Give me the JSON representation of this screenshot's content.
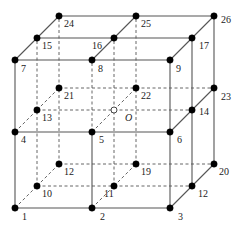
{
  "diagram": {
    "type": "3x3x3 cubic lattice of nodes (26 numbered nodes + center O)",
    "colors": {
      "line": "#555555",
      "node": "#000000",
      "center_node_fill": "#ffffff",
      "background": "#ffffff"
    },
    "offset": {
      "dx": 22,
      "dy": -22
    },
    "nodes": [
      {
        "id": "1",
        "label": "1",
        "x": 15,
        "y": 208,
        "lx": 7,
        "ly": 12
      },
      {
        "id": "2",
        "label": "2",
        "x": 92,
        "y": 208,
        "lx": 8,
        "ly": 12
      },
      {
        "id": "3",
        "label": "3",
        "x": 170,
        "y": 208,
        "lx": 8,
        "ly": 12
      },
      {
        "id": "4",
        "label": "4",
        "x": 15,
        "y": 132,
        "lx": 6,
        "ly": 11
      },
      {
        "id": "5",
        "label": "5",
        "x": 92,
        "y": 132,
        "lx": 7,
        "ly": 11
      },
      {
        "id": "6",
        "label": "6",
        "x": 170,
        "y": 132,
        "lx": 7,
        "ly": 11
      },
      {
        "id": "7",
        "label": "7",
        "x": 15,
        "y": 60,
        "lx": 6,
        "ly": 12
      },
      {
        "id": "8",
        "label": "8",
        "x": 92,
        "y": 60,
        "lx": 6,
        "ly": 12
      },
      {
        "id": "9",
        "label": "9",
        "x": 170,
        "y": 60,
        "lx": 6,
        "ly": 12
      },
      {
        "id": "10",
        "label": "10",
        "x": 37,
        "y": 186,
        "lx": 5,
        "ly": 11
      },
      {
        "id": "11",
        "label": "11",
        "x": 114,
        "y": 186,
        "lx": -10,
        "ly": 11
      },
      {
        "id": "12a",
        "label": "12",
        "x": 192,
        "y": 186,
        "lx": 6,
        "ly": 11
      },
      {
        "id": "13",
        "label": "13",
        "x": 37,
        "y": 110,
        "lx": 5,
        "ly": 11
      },
      {
        "id": "O",
        "label": "O",
        "x": 114,
        "y": 110,
        "lx": 11,
        "ly": 11,
        "hollow": true,
        "italic": true
      },
      {
        "id": "14",
        "label": "14",
        "x": 192,
        "y": 110,
        "lx": 7,
        "ly": 5
      },
      {
        "id": "15",
        "label": "15",
        "x": 37,
        "y": 38,
        "lx": 5,
        "ly": 11
      },
      {
        "id": "16",
        "label": "16",
        "x": 114,
        "y": 38,
        "lx": -22,
        "ly": 11
      },
      {
        "id": "17",
        "label": "17",
        "x": 192,
        "y": 38,
        "lx": 7,
        "ly": 11
      },
      {
        "id": "12b",
        "label": "12",
        "x": 59,
        "y": 164,
        "lx": 5,
        "ly": 11
      },
      {
        "id": "19",
        "label": "19",
        "x": 136,
        "y": 164,
        "lx": 5,
        "ly": 11
      },
      {
        "id": "20",
        "label": "20",
        "x": 214,
        "y": 164,
        "lx": 5,
        "ly": 11
      },
      {
        "id": "21",
        "label": "21",
        "x": 59,
        "y": 88,
        "lx": 5,
        "ly": 11
      },
      {
        "id": "22",
        "label": "22",
        "x": 136,
        "y": 88,
        "lx": 5,
        "ly": 11
      },
      {
        "id": "23",
        "label": "23",
        "x": 214,
        "y": 88,
        "lx": 7,
        "ly": 12
      },
      {
        "id": "24",
        "label": "24",
        "x": 59,
        "y": 16,
        "lx": 5,
        "ly": 11
      },
      {
        "id": "25",
        "label": "25",
        "x": 136,
        "y": 16,
        "lx": 5,
        "ly": 11
      },
      {
        "id": "26",
        "label": "26",
        "x": 214,
        "y": 16,
        "lx": 7,
        "ly": 7
      }
    ],
    "solid_edges": [
      [
        "1",
        "3"
      ],
      [
        "4",
        "6"
      ],
      [
        "7",
        "9"
      ],
      [
        "1",
        "7"
      ],
      [
        "2",
        "5"
      ],
      [
        "3",
        "9"
      ],
      [
        "7",
        "24"
      ],
      [
        "8",
        "25"
      ],
      [
        "9",
        "26"
      ],
      [
        "24",
        "26"
      ],
      [
        "15",
        "17"
      ],
      [
        "3",
        "20"
      ],
      [
        "6",
        "23"
      ],
      [
        "17",
        "12a"
      ],
      [
        "26",
        "20"
      ]
    ],
    "dashed_edges": [
      [
        "5",
        "8"
      ],
      [
        "1",
        "24"
      ],
      [
        "10",
        "12b"
      ],
      [
        "10",
        "15"
      ],
      [
        "12b",
        "24"
      ],
      [
        "114,186",
        "114,38"
      ],
      [
        "136,164",
        "136,16"
      ],
      [
        "10",
        "12a"
      ],
      [
        "12b",
        "20"
      ],
      [
        "13",
        "14"
      ],
      [
        "21",
        "23"
      ],
      [
        "4",
        "21"
      ],
      [
        "5",
        "22"
      ],
      [
        "2",
        "19"
      ],
      [
        "92,60",
        "92,132"
      ]
    ]
  }
}
